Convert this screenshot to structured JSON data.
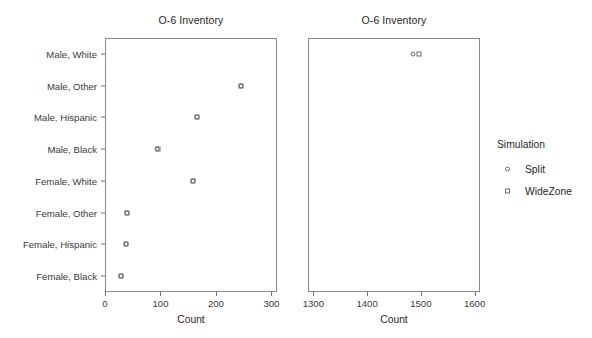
{
  "chart_data": {
    "type": "scatter",
    "title": "O-6 Inventory",
    "xlabel": "Count",
    "ylabel": "",
    "grid": false,
    "legend_position": "right",
    "categories": [
      "Male, White",
      "Male, Other",
      "Male, Hispanic",
      "Male, Black",
      "Female, White",
      "Female, Other",
      "Female, Hispanic",
      "Female, Black"
    ],
    "panels": [
      {
        "title": "O-6 Inventory",
        "xlabel": "Count",
        "xlim": [
          0,
          310
        ],
        "xticks": [
          0,
          100,
          200,
          300
        ],
        "xticklabels": [
          "0",
          "100",
          "200",
          "300"
        ],
        "series": [
          {
            "name": "Split",
            "marker": "circle",
            "points": [
              {
                "category": "Male, Other",
                "value": 246
              },
              {
                "category": "Male, Hispanic",
                "value": 165
              },
              {
                "category": "Male, Black",
                "value": 94
              },
              {
                "category": "Female, White",
                "value": 158
              },
              {
                "category": "Female, Other",
                "value": 39
              },
              {
                "category": "Female, Hispanic",
                "value": 37
              },
              {
                "category": "Female, Black",
                "value": 28
              }
            ]
          },
          {
            "name": "WideZone",
            "marker": "square",
            "points": [
              {
                "category": "Male, Other",
                "value": 246
              },
              {
                "category": "Male, Hispanic",
                "value": 165
              },
              {
                "category": "Male, Black",
                "value": 95
              },
              {
                "category": "Female, White",
                "value": 159
              },
              {
                "category": "Female, Other",
                "value": 39
              },
              {
                "category": "Female, Hispanic",
                "value": 37
              },
              {
                "category": "Female, Black",
                "value": 28
              }
            ]
          }
        ]
      },
      {
        "title": "O-6 Inventory",
        "xlabel": "Count",
        "xlim": [
          1290,
          1610
        ],
        "xticks": [
          1300,
          1400,
          1500,
          1600
        ],
        "xticklabels": [
          "1300",
          "1400",
          "1500",
          "1600"
        ],
        "series": [
          {
            "name": "Split",
            "marker": "circle",
            "points": [
              {
                "category": "Male, White",
                "value": 1486
              }
            ]
          },
          {
            "name": "WideZone",
            "marker": "square",
            "points": [
              {
                "category": "Male, White",
                "value": 1496
              }
            ]
          }
        ]
      }
    ]
  },
  "legend": {
    "title": "Simulation",
    "entries": [
      {
        "label": "Split",
        "marker": "circle"
      },
      {
        "label": "WideZone",
        "marker": "square"
      }
    ]
  },
  "colors": {
    "marker_stroke": "#6a6a6a",
    "frame": "#8a8a8a",
    "text": "#1f1f1f",
    "tick_text": "#3a3a3a",
    "background": "#ffffff"
  }
}
